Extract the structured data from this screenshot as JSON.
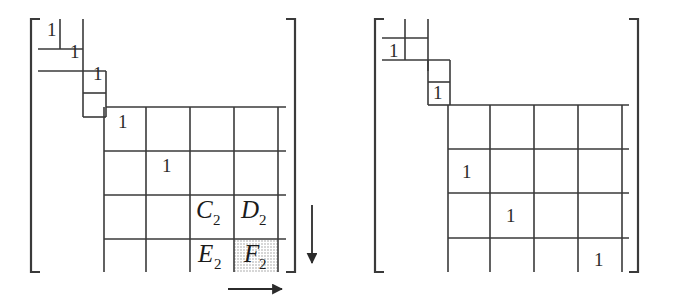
{
  "figure": {
    "type": "matrix-diagram",
    "line_color": "#3a3a3a",
    "text_color": "#1b1b1b",
    "shade_color": "#d9d9d9",
    "background": "#ffffff"
  },
  "matrices": [
    {
      "id": "left-matrix",
      "name": "left-matrix",
      "bracket_left": "[",
      "bracket_right": "]",
      "entries": [
        {
          "name": "entry-1-1",
          "value": "1",
          "x": 47,
          "y": 36
        },
        {
          "name": "entry-2-2",
          "value": "1",
          "x": 70,
          "y": 58
        },
        {
          "name": "entry-3-3",
          "value": "1",
          "x": 93,
          "y": 80
        },
        {
          "name": "entry-4-4",
          "value": "1",
          "x": 118,
          "y": 128
        },
        {
          "name": "entry-5-5",
          "value": "1",
          "x": 162,
          "y": 172
        }
      ],
      "block_labels": [
        {
          "name": "label-C2",
          "base": "C",
          "sub": "2",
          "x": 199,
          "y": 218
        },
        {
          "name": "label-D2",
          "base": "D",
          "sub": "2",
          "x": 243,
          "y": 218
        },
        {
          "name": "label-E2",
          "base": "E",
          "sub": "2",
          "x": 199,
          "y": 262
        },
        {
          "name": "label-F2",
          "base": "F",
          "sub": "2",
          "x": 243,
          "y": 262,
          "shaded": true
        }
      ],
      "arrows": [
        {
          "name": "down-arrow",
          "direction": "down"
        },
        {
          "name": "right-arrow",
          "direction": "right"
        }
      ]
    },
    {
      "id": "right-matrix",
      "name": "right-matrix",
      "bracket_left": "[",
      "bracket_right": "]",
      "entries": [
        {
          "name": "entry-1-1",
          "value": "1",
          "x": 392,
          "y": 47
        },
        {
          "name": "entry-2-2",
          "value": "1",
          "x": 416,
          "y": 92
        },
        {
          "name": "entry-3-3",
          "value": "1",
          "x": 440,
          "y": 172
        },
        {
          "name": "entry-4-4",
          "value": "1",
          "x": 484,
          "y": 216
        },
        {
          "name": "entry-5-5",
          "value": "1",
          "x": 572,
          "y": 262
        }
      ],
      "block_labels": [],
      "arrows": []
    }
  ]
}
